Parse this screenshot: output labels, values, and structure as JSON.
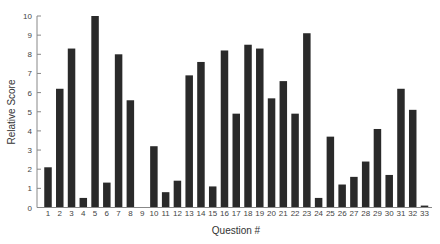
{
  "chart_data": {
    "type": "bar",
    "title": "",
    "xlabel": "Question #",
    "ylabel": "Relative Score",
    "ylim": [
      0,
      10
    ],
    "yticks": [
      0,
      1,
      2,
      3,
      4,
      5,
      6,
      7,
      8,
      9,
      10
    ],
    "grid": false,
    "legend": null,
    "bar_color": "#2a2a2a",
    "categories": [
      "1",
      "2",
      "3",
      "4",
      "5",
      "6",
      "7",
      "8",
      "9",
      "10",
      "11",
      "12",
      "13",
      "14",
      "15",
      "16",
      "17",
      "18",
      "19",
      "20",
      "21",
      "22",
      "23",
      "24",
      "25",
      "26",
      "27",
      "28",
      "29",
      "30",
      "31",
      "32",
      "33"
    ],
    "values": [
      2.1,
      6.2,
      8.3,
      0.5,
      10.0,
      1.3,
      8.0,
      5.6,
      0,
      3.2,
      0.8,
      1.4,
      6.9,
      7.6,
      1.1,
      8.2,
      4.9,
      8.5,
      8.3,
      5.7,
      6.6,
      4.9,
      9.1,
      0.5,
      3.7,
      1.2,
      1.6,
      2.4,
      4.1,
      1.7,
      6.2,
      5.1,
      0.1
    ]
  }
}
